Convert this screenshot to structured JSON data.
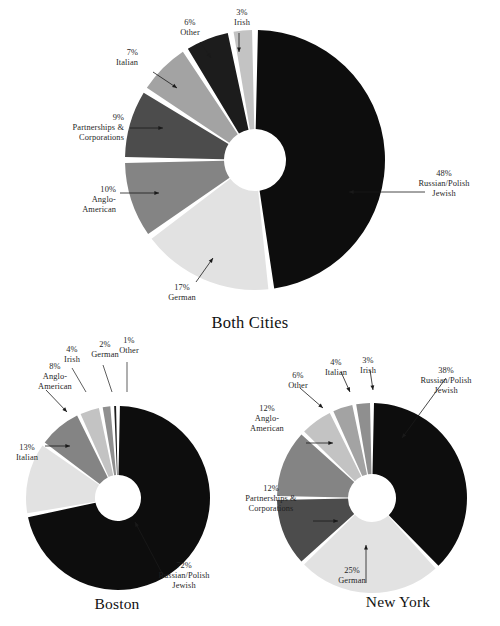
{
  "chart_data": [
    {
      "type": "pie",
      "title": "Both Cities",
      "id": "both-cities",
      "donut": true,
      "categories": [
        "Russian/Polish Jewish",
        "German",
        "Anglo-American",
        "Partnerships & Corporations",
        "Italian",
        "Other",
        "Irish"
      ],
      "values": [
        48,
        17,
        10,
        9,
        7,
        6,
        3
      ],
      "value_labels": [
        "48%",
        "17%",
        "10%",
        "9%",
        "7%",
        "6%",
        "3%"
      ],
      "colors": [
        "#0d0d0d",
        "#e2e2e2",
        "#848484",
        "#4c4c4c",
        "#a3a3a3",
        "#1c1c1c",
        "#c3c3c3"
      ],
      "xlabel": "",
      "ylabel": "",
      "legend": "none",
      "grid": false
    },
    {
      "type": "pie",
      "title": "Boston",
      "id": "boston",
      "donut": true,
      "categories": [
        "Russian/Polish Jewish",
        "Italian",
        "Anglo-American",
        "Irish",
        "German",
        "Other"
      ],
      "values": [
        72,
        13,
        8,
        4,
        2,
        1
      ],
      "value_labels": [
        "72%",
        "13%",
        "8%",
        "4%",
        "2%",
        "1%"
      ],
      "colors": [
        "#0d0d0d",
        "#e2e2e2",
        "#848484",
        "#c3c3c3",
        "#8f8f8f",
        "#1c1c1c"
      ],
      "xlabel": "",
      "ylabel": "",
      "legend": "none",
      "grid": false
    },
    {
      "type": "pie",
      "title": "New York",
      "id": "new-york",
      "donut": true,
      "categories": [
        "Russian/Polish Jewish",
        "German",
        "Partnerships & Corporations",
        "Anglo-American",
        "Other",
        "Italian",
        "Irish"
      ],
      "values": [
        38,
        25,
        12,
        12,
        6,
        4,
        3
      ],
      "value_labels": [
        "38%",
        "25%",
        "12%",
        "12%",
        "6%",
        "4%",
        "3%"
      ],
      "colors": [
        "#0d0d0d",
        "#e2e2e2",
        "#4c4c4c",
        "#848484",
        "#c3c3c3",
        "#a3a3a3",
        "#8f8f8f"
      ],
      "xlabel": "",
      "ylabel": "",
      "legend": "none",
      "grid": false
    }
  ],
  "both": {
    "title": "Both Cities",
    "labels": {
      "russian_pct": "48%",
      "russian_l1": "Russian/Polish",
      "russian_l2": "Jewish",
      "german_pct": "17%",
      "german_name": "German",
      "anglo_pct": "10%",
      "anglo_l1": "Anglo-",
      "anglo_l2": "American",
      "partner_pct": "9%",
      "partner_l1": "Partnerships &",
      "partner_l2": "Corporations",
      "italian_pct": "7%",
      "italian_name": "Italian",
      "other_pct": "6%",
      "other_name": "Other",
      "irish_pct": "3%",
      "irish_name": "Irish"
    }
  },
  "boston": {
    "title": "Boston",
    "labels": {
      "russian_pct": "72%",
      "russian_l1": "Russian/Polish",
      "russian_l2": "Jewish",
      "italian_pct": "13%",
      "italian_name": "Italian",
      "anglo_pct": "8%",
      "anglo_l1": "Anglo-",
      "anglo_l2": "American",
      "irish_pct": "4%",
      "irish_name": "Irish",
      "german_pct": "2%",
      "german_name": "German",
      "other_pct": "1%",
      "other_name": "Other"
    }
  },
  "newyork": {
    "title": "New York",
    "labels": {
      "russian_pct": "38%",
      "russian_l1": "Russian/Polish",
      "russian_l2": "Jewish",
      "german_pct": "25%",
      "german_name": "German",
      "partner_pct": "12%",
      "partner_l1": "Partnerships &",
      "partner_l2": "Corporations",
      "anglo_pct": "12%",
      "anglo_l1": "Anglo-",
      "anglo_l2": "American",
      "other_pct": "6%",
      "other_name": "Other",
      "italian_pct": "4%",
      "italian_name": "Italian",
      "irish_pct": "3%",
      "irish_name": "Irish"
    }
  }
}
